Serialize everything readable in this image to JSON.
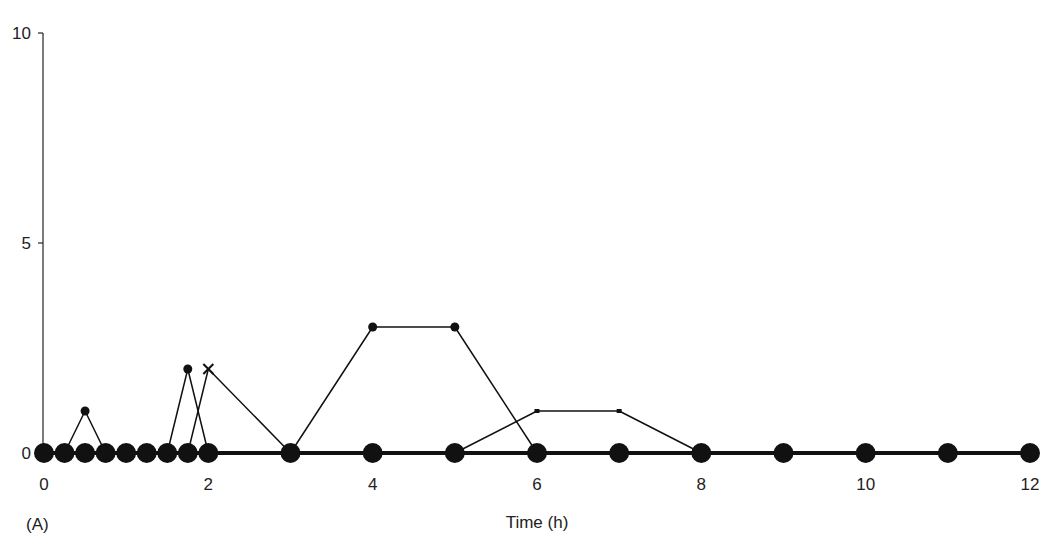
{
  "chart_data": {
    "type": "line",
    "title": "",
    "panel_label": "(A)",
    "xlabel": "Time (h)",
    "ylabel": "",
    "xlim": [
      0,
      12
    ],
    "ylim": [
      0,
      10
    ],
    "x_ticks": [
      0,
      2,
      4,
      6,
      8,
      10,
      12
    ],
    "y_ticks": [
      0,
      5,
      10
    ],
    "grid": false,
    "legend": null,
    "series": [
      {
        "name": "baseline",
        "marker": "large-circle",
        "line_width": 4,
        "x": [
          0,
          0.25,
          0.5,
          0.75,
          1,
          1.25,
          1.5,
          1.75,
          2,
          3,
          4,
          5,
          6,
          7,
          8,
          9,
          10,
          11,
          12
        ],
        "y": [
          0,
          0,
          0,
          0,
          0,
          0,
          0,
          0,
          0,
          0,
          0,
          0,
          0,
          0,
          0,
          0,
          0,
          0,
          0
        ]
      },
      {
        "name": "series-dot",
        "marker": "small-circle",
        "line_width": 1.5,
        "x": [
          0.25,
          0.5,
          0.75
        ],
        "y": [
          0,
          1,
          0
        ]
      },
      {
        "name": "series-dot-2",
        "marker": "small-circle",
        "line_width": 1.5,
        "x": [
          1.5,
          1.75,
          2
        ],
        "y": [
          0,
          2,
          0
        ]
      },
      {
        "name": "series-cross",
        "marker": "x",
        "line_width": 1.5,
        "x": [
          1.75,
          2,
          3
        ],
        "y": [
          0,
          2,
          0
        ]
      },
      {
        "name": "series-dot-3",
        "marker": "small-circle",
        "line_width": 1.5,
        "x": [
          3,
          4,
          5,
          6
        ],
        "y": [
          0,
          3,
          3,
          0
        ]
      },
      {
        "name": "series-square",
        "marker": "small-square",
        "line_width": 1.5,
        "x": [
          5,
          6,
          7,
          8
        ],
        "y": [
          0,
          1,
          1,
          0
        ]
      }
    ]
  },
  "colors": {
    "ink": "#111111",
    "axis": "#333333",
    "background": "#ffffff"
  }
}
